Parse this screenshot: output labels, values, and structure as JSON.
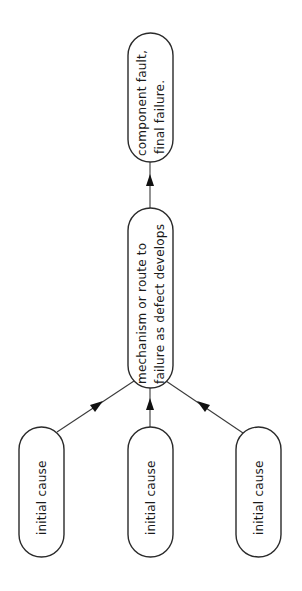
{
  "diagram": {
    "type": "flow",
    "orientation": "bottom-to-top, text rotated 90deg counter-clockwise",
    "nodes": [
      {
        "id": "final",
        "lines": [
          "component fault,",
          "final failure."
        ]
      },
      {
        "id": "mechanism",
        "lines": [
          "mechanism or route to",
          "failure as defect develops"
        ]
      },
      {
        "id": "cause1",
        "lines": [
          "initial cause"
        ]
      },
      {
        "id": "cause2",
        "lines": [
          "initial cause"
        ]
      },
      {
        "id": "cause3",
        "lines": [
          "initial cause"
        ]
      }
    ],
    "edges": [
      {
        "from": "cause1",
        "to": "mechanism"
      },
      {
        "from": "cause2",
        "to": "mechanism"
      },
      {
        "from": "cause3",
        "to": "mechanism"
      },
      {
        "from": "mechanism",
        "to": "final"
      }
    ],
    "colors": {
      "stroke": "#2a2a2a",
      "text": "#1a1a1a",
      "background": "#ffffff"
    }
  }
}
